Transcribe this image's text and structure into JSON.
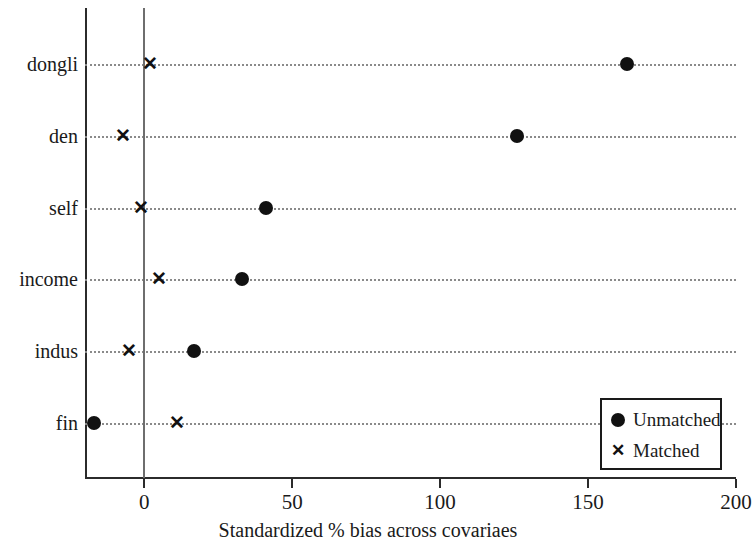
{
  "chart_data": {
    "type": "scatter",
    "title": "",
    "xlabel": "Standardized % bias across covariaes",
    "ylabel": "",
    "xlim": [
      -20,
      200
    ],
    "xticks": [
      0,
      50,
      100,
      150,
      200
    ],
    "xtick_labels": [
      "0",
      "50",
      "100",
      "150",
      "200"
    ],
    "categories": [
      "dongli",
      "den",
      "self",
      "income",
      "indus",
      "fin"
    ],
    "grid": true,
    "grid_style": "dotted-horizontal",
    "zero_reference_line": 0,
    "legend_position": "bottom-right",
    "series": [
      {
        "name": "Unmatched",
        "marker": "filled-circle",
        "values": [
          163,
          126,
          41,
          33,
          17,
          -17
        ]
      },
      {
        "name": "Matched",
        "marker": "x",
        "values": [
          2,
          -7,
          -1,
          5,
          -5,
          11
        ]
      }
    ]
  },
  "axis": {
    "x_title": "Standardized % bias across covariaes",
    "x_tick_labels": [
      "0",
      "50",
      "100",
      "150",
      "200"
    ],
    "y_tick_labels": [
      "dongli",
      "den",
      "self",
      "income",
      "indus",
      "fin"
    ]
  },
  "legend": {
    "items": [
      {
        "label": "Unmatched",
        "symbol": "filled-circle-marker"
      },
      {
        "label": "Matched",
        "symbol": "x-marker"
      }
    ]
  },
  "colors": {
    "marker": "#111111",
    "axis": "#2b2b2b",
    "grid": "#8a8a8a",
    "zero_line": "#6e6e6e",
    "background": "#ffffff"
  }
}
